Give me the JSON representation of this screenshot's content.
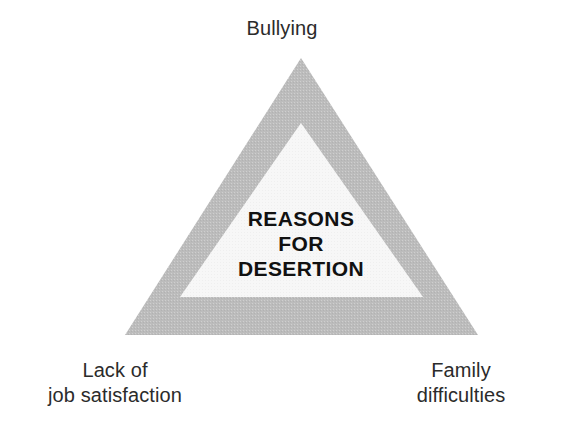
{
  "diagram": {
    "type": "triangle-concept-diagram",
    "center": {
      "lines": [
        "REASONS",
        "FOR",
        "DESERTION"
      ],
      "line1": "REASONS",
      "line2": "FOR",
      "line3": "DESERTION"
    },
    "vertices": {
      "top": {
        "lines": [
          "Bullying"
        ],
        "line1": "Bullying"
      },
      "bottom_left": {
        "lines": [
          "Lack of",
          "job satisfaction"
        ],
        "line1": "Lack of",
        "line2": "job satisfaction"
      },
      "bottom_right": {
        "lines": [
          "Family",
          "difficulties"
        ],
        "line1": "Family",
        "line2": "difficulties"
      }
    },
    "colors": {
      "background": "#ffffff",
      "outer_triangle_fill": "#bcbcbc",
      "inner_triangle_fill": "#f7f7f7",
      "label_text": "#2b2b2b",
      "center_text": "#111111"
    },
    "geometry": {
      "outer_triangle_points": "301,58 478,335 125,335",
      "inner_triangle_points": "301,123 423,297 180,297"
    }
  }
}
